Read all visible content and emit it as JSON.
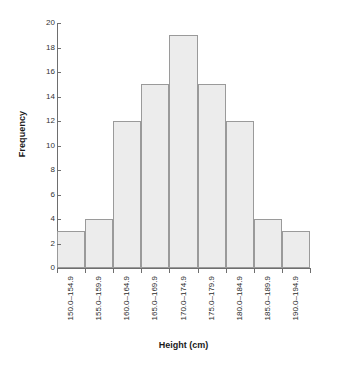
{
  "chart_data": {
    "type": "bar",
    "title": "",
    "subtitle": "",
    "xlabel": "Height (cm)",
    "ylabel": "Frequency",
    "categories": [
      "150.0–154.9",
      "155.0–159.9",
      "160.0–164.9",
      "165.0–169.9",
      "170.0–174.9",
      "175.0–179.9",
      "180.0–184.9",
      "185.0–189.9",
      "190.0–194.9"
    ],
    "values": [
      3,
      4,
      12,
      15,
      19,
      15,
      12,
      4,
      3
    ],
    "ylim": [
      0,
      20
    ],
    "yticks": [
      0,
      2,
      4,
      6,
      8,
      10,
      12,
      14,
      16,
      18,
      20
    ],
    "ytick_labels": [
      "0",
      "2",
      "4",
      "6",
      "8",
      "10",
      "12",
      "14",
      "16",
      "18",
      "20"
    ],
    "grid": false,
    "legend": false,
    "legend_position": "none",
    "bar_gap": 0,
    "colors": {
      "bar_fill": "#ececec",
      "bar_stroke": "#9a9a9a",
      "axis": "#6e6e6e",
      "text": "#1a1a1a",
      "background": "#ffffff"
    }
  }
}
